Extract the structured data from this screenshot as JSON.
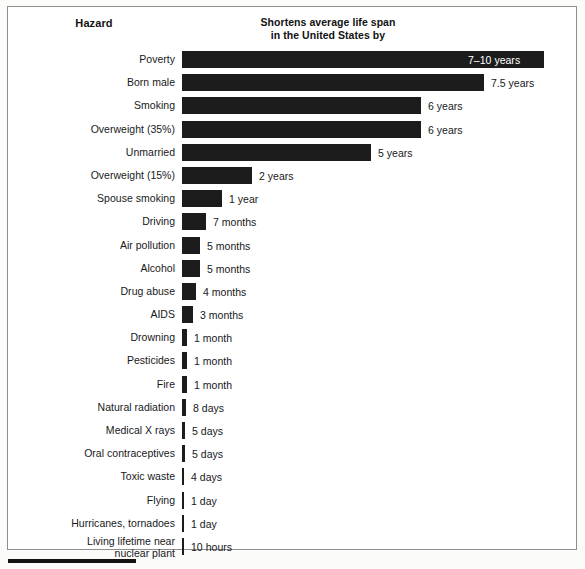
{
  "chart_data": {
    "type": "bar",
    "orientation": "horizontal",
    "title": "",
    "column_headers": {
      "category": "Hazard",
      "value_line1": "Shortens average life span",
      "value_line2": "in the United States by"
    },
    "xlabel": "",
    "ylabel": "Hazard",
    "grid": false,
    "legend": "none",
    "categories": [
      "Poverty",
      "Born male",
      "Smoking",
      "Overweight (35%)",
      "Unmarried",
      "Overweight (15%)",
      "Spouse smoking",
      "Driving",
      "Air pollution",
      "Alcohol",
      "Drug abuse",
      "AIDS",
      "Drowning",
      "Pesticides",
      "Fire",
      "Natural radiation",
      "Medical X rays",
      "Oral contraceptives",
      "Toxic waste",
      "Flying",
      "Hurricanes, tornadoes",
      "Living lifetime near nuclear plant"
    ],
    "value_labels": [
      "7–10 years",
      "7.5 years",
      "6 years",
      "6 years",
      "5 years",
      "2 years",
      "1 year",
      "7 months",
      "5 months",
      "5 months",
      "4 months",
      "3 months",
      "1 month",
      "1 month",
      "1 month",
      "8 days",
      "5 days",
      "5 days",
      "4 days",
      "1 day",
      "1 day",
      "10 hours"
    ],
    "values_in_years": [
      10,
      7.5,
      6,
      6,
      5,
      2,
      1,
      0.583,
      0.417,
      0.417,
      0.333,
      0.25,
      0.083,
      0.083,
      0.083,
      0.0219,
      0.0137,
      0.0137,
      0.011,
      0.0027,
      0.0027,
      0.00114
    ],
    "value_units": [
      "years",
      "years",
      "years",
      "years",
      "years",
      "years",
      "year",
      "months",
      "months",
      "months",
      "months",
      "months",
      "month",
      "month",
      "month",
      "days",
      "days",
      "days",
      "days",
      "day",
      "day",
      "hours"
    ]
  },
  "rows": [
    {
      "label": "Poverty",
      "label_line2": "",
      "value": "7–10 years",
      "bar_px": 362,
      "label_inside": true
    },
    {
      "label": "Born male",
      "label_line2": "",
      "value": "7.5 years",
      "bar_px": 302,
      "label_inside": false
    },
    {
      "label": "Smoking",
      "label_line2": "",
      "value": "6 years",
      "bar_px": 239,
      "label_inside": false
    },
    {
      "label": "Overweight (35%)",
      "label_line2": "",
      "value": "6 years",
      "bar_px": 239,
      "label_inside": false
    },
    {
      "label": "Unmarried",
      "label_line2": "",
      "value": "5 years",
      "bar_px": 189,
      "label_inside": false
    },
    {
      "label": "Overweight (15%)",
      "label_line2": "",
      "value": "2 years",
      "bar_px": 70,
      "label_inside": false
    },
    {
      "label": "Spouse smoking",
      "label_line2": "",
      "value": "1 year",
      "bar_px": 40,
      "label_inside": false
    },
    {
      "label": "Driving",
      "label_line2": "",
      "value": "7 months",
      "bar_px": 24,
      "label_inside": false
    },
    {
      "label": "Air pollution",
      "label_line2": "",
      "value": "5 months",
      "bar_px": 18,
      "label_inside": false
    },
    {
      "label": "Alcohol",
      "label_line2": "",
      "value": "5 months",
      "bar_px": 18,
      "label_inside": false
    },
    {
      "label": "Drug abuse",
      "label_line2": "",
      "value": "4 months",
      "bar_px": 14,
      "label_inside": false
    },
    {
      "label": "AIDS",
      "label_line2": "",
      "value": "3 months",
      "bar_px": 11,
      "label_inside": false
    },
    {
      "label": "Drowning",
      "label_line2": "",
      "value": "1 month",
      "bar_px": 5,
      "label_inside": false
    },
    {
      "label": "Pesticides",
      "label_line2": "",
      "value": "1 month",
      "bar_px": 5,
      "label_inside": false
    },
    {
      "label": "Fire",
      "label_line2": "",
      "value": "1 month",
      "bar_px": 5,
      "label_inside": false
    },
    {
      "label": "Natural radiation",
      "label_line2": "",
      "value": "8 days",
      "bar_px": 4,
      "label_inside": false
    },
    {
      "label": "Medical X rays",
      "label_line2": "",
      "value": "5 days",
      "bar_px": 3,
      "label_inside": false
    },
    {
      "label": "Oral contraceptives",
      "label_line2": "",
      "value": "5 days",
      "bar_px": 3,
      "label_inside": false
    },
    {
      "label": "Toxic waste",
      "label_line2": "",
      "value": "4 days",
      "bar_px": 2,
      "label_inside": false
    },
    {
      "label": "Flying",
      "label_line2": "",
      "value": "1 day",
      "bar_px": 2,
      "label_inside": false
    },
    {
      "label": "Hurricanes, tornadoes",
      "label_line2": "",
      "value": "1 day",
      "bar_px": 2,
      "label_inside": false
    },
    {
      "label": "Living lifetime near",
      "label_line2": "nuclear plant",
      "value": "10 hours",
      "bar_px": 2,
      "label_inside": false
    }
  ],
  "style": {
    "bar_color": "#1c1c1c",
    "text_color": "#17181a",
    "frame_color": "#8e8e8e",
    "background": "#ffffff"
  }
}
